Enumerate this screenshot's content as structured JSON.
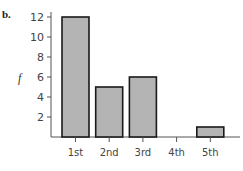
{
  "panel_label": "b.",
  "chart_data": {
    "type": "bar",
    "title": "",
    "xlabel": "",
    "ylabel": "f",
    "categories": [
      "1st",
      "2nd",
      "3rd",
      "4th",
      "5th"
    ],
    "values": [
      12,
      5,
      6,
      0,
      1
    ],
    "yticks": [
      2,
      4,
      6,
      8,
      10,
      12
    ],
    "ylim": [
      0,
      12
    ],
    "grid": false,
    "legend": null,
    "bar_color": "#b4b4b4",
    "bar_edge_color": "#1a1a1a"
  }
}
